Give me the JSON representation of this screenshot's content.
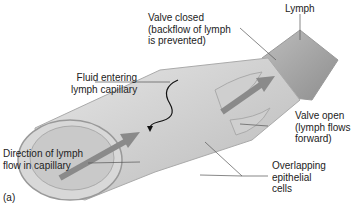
{
  "figure": {
    "panel_label": "(a)",
    "labels": {
      "lymph": "Lymph",
      "valve_closed": [
        "Valve closed",
        "(backflow of lymph",
        "is prevented)"
      ],
      "fluid_entering": [
        "Fluid entering",
        "lymph capillary"
      ],
      "valve_open": [
        "Valve open",
        "(lymph flows",
        "forward)"
      ],
      "direction": [
        "Direction of lymph",
        "flow in capillary"
      ],
      "overlapping": [
        "Overlapping",
        "epithelial",
        "cells"
      ]
    }
  }
}
